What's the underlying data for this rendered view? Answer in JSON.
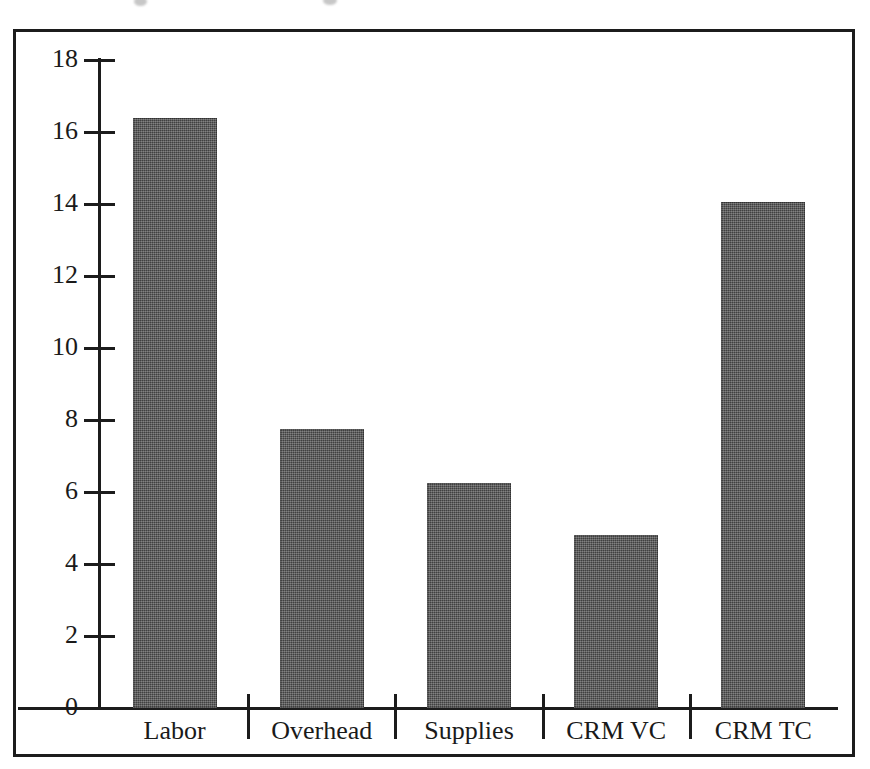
{
  "chart_data": {
    "type": "bar",
    "title": "",
    "subtitle": "",
    "xlabel": "",
    "ylabel": "",
    "categories": [
      "Labor",
      "Overhead",
      "Supplies",
      "CRM VC",
      "CRM TC"
    ],
    "values": [
      16.4,
      7.75,
      6.25,
      4.8,
      14.05
    ],
    "series": [
      {
        "name": "Cost",
        "values": [
          16.4,
          7.75,
          6.25,
          4.8,
          14.05
        ]
      }
    ],
    "ylim": [
      0,
      18
    ],
    "ytick_labels": [
      "0",
      "2",
      "4",
      "6",
      "8",
      "10",
      "12",
      "14",
      "16",
      "18"
    ],
    "ytick_values": [
      0,
      2,
      4,
      6,
      8,
      10,
      12,
      14,
      16,
      18
    ],
    "grid": false,
    "legend": false,
    "legend_position": "none",
    "annotations": [],
    "bar_color": "#4f4f4f",
    "axis_color": "#1c1c1c",
    "background_color": "#ffffff"
  },
  "figure": {
    "border_color": "#1c1c1c",
    "y_axis_name": "y-axis",
    "x_axis_name": "x-axis"
  }
}
